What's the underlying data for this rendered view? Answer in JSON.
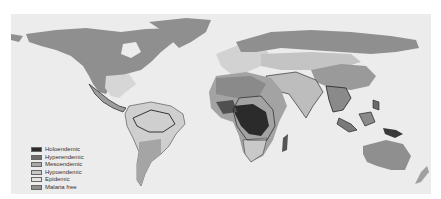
{
  "map": {
    "title": "Global malaria endemicity",
    "background": "#ececec",
    "ocean_color": "#ececec",
    "regions": {
      "malaria_free_color": "#8f8f8f",
      "holoendemic_color": "#2b2b2b",
      "hyperendemic_color": "#6c6c6c",
      "mesoendemic_color": "#a8a8a8",
      "hypoendemic_color": "#c6c6c6",
      "epidemic_color": "#dcdcdc"
    }
  },
  "legend": {
    "items": [
      {
        "label": "Holoendemic",
        "color": "#2b2b2b"
      },
      {
        "label": "Hyperendemic",
        "color": "#6c6c6c"
      },
      {
        "label": "Mesoendemic",
        "color": "#a8a8a8"
      },
      {
        "label": "Hypoendemic",
        "color": "#c6c6c6"
      },
      {
        "label": "Epidemic",
        "color": "#e4e4e4"
      },
      {
        "label": "Malaria free",
        "color": "#8f8f8f"
      }
    ]
  }
}
